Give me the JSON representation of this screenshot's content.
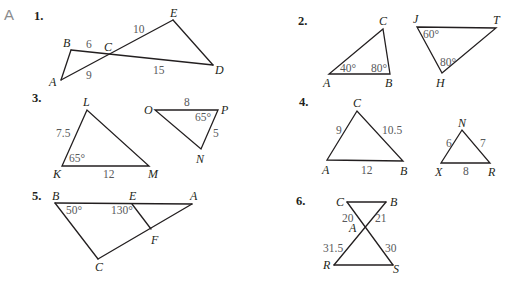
{
  "section_label": "A",
  "problems": [
    {
      "number": "1.",
      "vertices": {
        "A": "A",
        "B": "B",
        "C": "C",
        "D": "D",
        "E": "E"
      },
      "measures": {
        "BC": "6",
        "CE": "10",
        "AC": "9",
        "CD": "15"
      }
    },
    {
      "number": "2.",
      "vertices": {
        "A": "A",
        "B": "B",
        "C": "C",
        "J": "J",
        "T": "T",
        "H": "H"
      },
      "measures": {
        "angle_A": "40°",
        "angle_B": "80°",
        "angle_J": "60°",
        "angle_H": "80°"
      }
    },
    {
      "number": "3.",
      "vertices": {
        "L": "L",
        "K": "K",
        "M": "M",
        "O": "O",
        "P": "P",
        "N": "N"
      },
      "measures": {
        "KL": "7.5",
        "KM": "12",
        "angle_K": "65°",
        "OP": "8",
        "PN": "5",
        "angle_P": "65°"
      }
    },
    {
      "number": "4.",
      "vertices": {
        "A": "A",
        "B": "B",
        "C": "C",
        "N": "N",
        "X": "X",
        "R": "R"
      },
      "measures": {
        "AC": "9",
        "CB": "10.5",
        "AB": "12",
        "XN": "6",
        "NR": "7",
        "XR": "8"
      }
    },
    {
      "number": "5.",
      "vertices": {
        "B": "B",
        "E": "E",
        "A": "A",
        "F": "F",
        "C": "C"
      },
      "measures": {
        "angle_B": "50°",
        "angle_E": "130°"
      }
    },
    {
      "number": "6.",
      "vertices": {
        "C": "C",
        "B": "B",
        "A": "A",
        "R": "R",
        "S": "S"
      },
      "measures": {
        "CA": "20",
        "AB": "21",
        "RA": "31.5",
        "AS": "30"
      }
    }
  ]
}
